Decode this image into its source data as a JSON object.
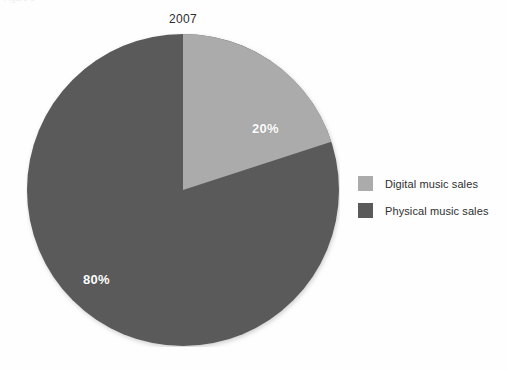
{
  "figure": {
    "caption_remnant": "Figure 1",
    "background_color": "#fefefe"
  },
  "chart_data": {
    "type": "pie",
    "title": "2007",
    "xlabel": "",
    "ylabel": "",
    "categories": [
      "Digital music sales",
      "Physical music sales"
    ],
    "values": [
      20,
      80
    ],
    "value_labels": [
      "20%",
      "80%"
    ],
    "unit": "percent",
    "colors": [
      "#ababab",
      "#5a5a5a"
    ],
    "start_angle_deg": 0,
    "direction": "clockwise",
    "legend_position": "right",
    "grid": false,
    "slices": [
      {
        "name": "Digital music sales",
        "value": 20,
        "label": "20%",
        "color": "#ababab",
        "start_deg": 0,
        "end_deg": 72
      },
      {
        "name": "Physical music sales",
        "value": 80,
        "label": "80%",
        "color": "#5a5a5a",
        "start_deg": 72,
        "end_deg": 360
      }
    ]
  },
  "legend": {
    "items": [
      {
        "label": "Digital music sales",
        "color": "#ababab"
      },
      {
        "label": "Physical music sales",
        "color": "#5a5a5a"
      }
    ]
  },
  "labels": {
    "digital_pct": "20%",
    "physical_pct": "80%"
  },
  "colors": {
    "digital": "#ababab",
    "physical": "#5a5a5a",
    "label_text": "#ffffff",
    "title_text": "#2d2d2d",
    "legend_text": "#2f2f2f"
  }
}
